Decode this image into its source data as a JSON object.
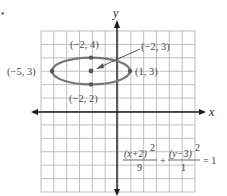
{
  "problem_marker": "•",
  "chart_data": {
    "type": "scatter",
    "title": "",
    "xlabel": "x",
    "ylabel": "y",
    "xlim": [
      -6,
      6
    ],
    "ylim": [
      -6,
      6
    ],
    "grid": true,
    "curve": {
      "kind": "ellipse",
      "center": [
        -2,
        3
      ],
      "a": 3,
      "b": 1,
      "equation": "(x+2)^2/9 + (y-3)^2/1 = 1"
    },
    "points": [
      {
        "x": -5,
        "y": 3,
        "label": "(−5, 3)",
        "role": "vertex"
      },
      {
        "x": 1,
        "y": 3,
        "label": "(1, 3)",
        "role": "vertex"
      },
      {
        "x": -2,
        "y": 4,
        "label": "(−2, 4)",
        "role": "co-vertex"
      },
      {
        "x": -2,
        "y": 2,
        "label": "(−2, 2)",
        "role": "co-vertex"
      },
      {
        "x": -2,
        "y": 3,
        "label": "(−2, 3)",
        "role": "center"
      }
    ]
  },
  "axes": {
    "x_label": "x",
    "y_label": "y"
  },
  "labels": {
    "left_vertex": "(−5, 3)",
    "right_vertex": "(1, 3)",
    "top_covertex": "(−2, 4)",
    "bottom_covertex": "(−2, 2)",
    "center": "(−2, 3)"
  },
  "equation": {
    "term1_num": "(x+2)",
    "term1_exp": "2",
    "term1_den": "9",
    "plus": "+",
    "term2_num": "(y−3)",
    "term2_exp": "2",
    "term2_den": "1",
    "rhs": "= 1"
  },
  "colors": {
    "grid": "#b8b8b8",
    "axis": "#1a1a1a",
    "ellipse": "#777777",
    "point": "#555555",
    "text": "#4a4a4a"
  }
}
